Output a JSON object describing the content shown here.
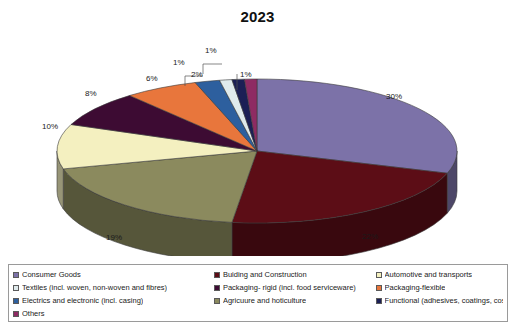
{
  "chart_data": {
    "type": "pie",
    "title": "2023",
    "xlabel": "",
    "ylabel": "",
    "legend_position": "bottom",
    "grid": false,
    "three_d": true,
    "start_angle_deg": 0,
    "direction": "clockwise",
    "unit": "%",
    "categories": [
      "Consumer Goods",
      "Buiding and Construction",
      "Agricuure and hoticulture",
      "Automotive and transports",
      "Others",
      "Packaging-flexible",
      "Electrics and electronic (incl. casing)",
      "Textiles (incl. woven, non-woven and fibres)",
      "Functional (adhesives, coatings, cosmetics etc.)",
      "Packaging- rigid (incl. food serviceware)"
    ],
    "values": [
      30,
      22,
      19,
      10,
      8,
      6,
      2,
      1,
      1,
      1
    ],
    "labels": [
      "30%",
      "22%",
      "19%",
      "10%",
      "8%",
      "6%",
      "2%",
      "1%",
      "1%",
      "1%"
    ],
    "colors": [
      "#7c72a8",
      "#5c0d16",
      "#8b8a5e",
      "#f4f0c0",
      "#3d0b33",
      "#e8763c",
      "#2d5f9e",
      "#dfeaec",
      "#1b1f55",
      "#8e2b63"
    ]
  },
  "legend": {
    "items": [
      {
        "label": "Consumer Goods",
        "color": "#7c72a8",
        "column": 0
      },
      {
        "label": "Buiding and Construction",
        "color": "#5c0d16",
        "column": 1
      },
      {
        "label": "Automotive and transports",
        "color": "#f4f0c0",
        "column": 2
      },
      {
        "label": "Textiles (incl. woven, non-woven and fibres)",
        "color": "#dfeaec",
        "column": 0
      },
      {
        "label": "Packaging- rigid (incl. food serviceware)",
        "color": "#3d0b33",
        "column": 1
      },
      {
        "label": "Packaging-flexible",
        "color": "#e8763c",
        "column": 2
      },
      {
        "label": "Electrics and electronic (incl. casing)",
        "color": "#2d5f9e",
        "column": 0
      },
      {
        "label": "Agricuure and hoticulture",
        "color": "#8b8a5e",
        "column": 1
      },
      {
        "label": "Functional (adhesives, coatings, cosmetics etc.)",
        "color": "#1b1f55",
        "column": 2
      },
      {
        "label": "Others",
        "color": "#8e2b63",
        "column": 0
      }
    ]
  },
  "data_labels": [
    {
      "text": "30%",
      "x": 386,
      "y": 92
    },
    {
      "text": "22%",
      "x": 362,
      "y": 232
    },
    {
      "text": "19%",
      "x": 106,
      "y": 233
    },
    {
      "text": "10%",
      "x": 42,
      "y": 122
    },
    {
      "text": "8%",
      "x": 85,
      "y": 89
    },
    {
      "text": "6%",
      "x": 147,
      "y": 74
    },
    {
      "text": "2%",
      "x": 192,
      "y": 70
    },
    {
      "text": "1%a",
      "x": 190,
      "y": 54
    },
    {
      "text": "1%b",
      "x": 208,
      "y": 44
    },
    {
      "text": "1%c",
      "x": 241,
      "y": 70
    }
  ]
}
